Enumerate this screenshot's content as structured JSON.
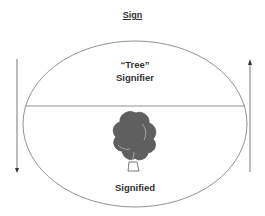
{
  "diagram": {
    "title": "Sign",
    "upper_section": {
      "word": "“Tree”",
      "label": "Signifier"
    },
    "lower_section": {
      "image": "tree-icon",
      "label": "Signified"
    },
    "arrows": [
      {
        "side": "left",
        "direction": "down"
      },
      {
        "side": "right",
        "direction": "up"
      }
    ],
    "colors": {
      "stroke": "#666666",
      "tree_foliage": "#5f5f5f",
      "text": "#333333"
    }
  }
}
